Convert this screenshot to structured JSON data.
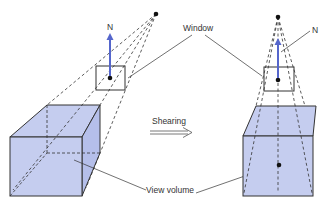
{
  "labels": {
    "n_left": "N",
    "n_right": "N",
    "window": "Window",
    "shearing": "Shearing",
    "view_volume": "View volume"
  },
  "colors": {
    "volume_fill": "#c5cdef",
    "normal_arrow": "#5566cc",
    "line": "#333333"
  }
}
